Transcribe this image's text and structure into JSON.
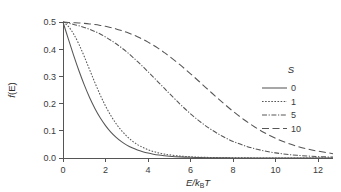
{
  "figure": {
    "background_color": "#ffffff",
    "line_color": "#565656",
    "axis_color": "#555555",
    "width": 341,
    "height": 192
  },
  "chart_data": {
    "type": "line",
    "title": "",
    "subtitle": "",
    "xlabel": "E/kBT",
    "xlabel_parts": {
      "lead": "E/k",
      "sub": "B",
      "tail": "T"
    },
    "ylabel": "f(E)",
    "ylabel_parts": {
      "lead": "f",
      "tail": "(E)"
    },
    "xlim": [
      0,
      12.7
    ],
    "ylim": [
      0,
      0.5
    ],
    "xticks": [
      0,
      2,
      4,
      6,
      8,
      10,
      12
    ],
    "xticklabels": [
      "0",
      "2",
      "4",
      "6",
      "8",
      "10",
      "12"
    ],
    "yticks": [
      0.0,
      0.1,
      0.2,
      0.3,
      0.4,
      0.5
    ],
    "yticklabels": [
      "0.0",
      "0.1",
      "0.2",
      "0.3",
      "0.4",
      "0.5"
    ],
    "grid": false,
    "legend_position": "right",
    "legend_title": "S",
    "x": [
      0,
      0.25,
      0.5,
      0.75,
      1,
      1.25,
      1.5,
      1.75,
      2,
      2.25,
      2.5,
      2.75,
      3,
      3.25,
      3.5,
      3.75,
      4,
      4.25,
      4.5,
      4.75,
      5,
      5.5,
      6,
      6.5,
      7,
      7.5,
      8,
      8.5,
      9,
      9.5,
      10,
      10.5,
      11,
      11.5,
      12,
      12.7
    ],
    "series": [
      {
        "name": "0",
        "label": "0",
        "linestyle": "solid",
        "dasharray": "",
        "values": [
          0.5,
          0.4378,
          0.3775,
          0.3208,
          0.2689,
          0.2227,
          0.1824,
          0.148,
          0.1192,
          0.0953,
          0.0759,
          0.0601,
          0.0474,
          0.0373,
          0.0293,
          0.023,
          0.018,
          0.0141,
          0.011,
          0.0086,
          0.0067,
          0.0041,
          0.0025,
          0.0015,
          0.0009,
          0.0006,
          0.0003,
          0.0002,
          0.0001,
          0.0001,
          0.0,
          0.0,
          0.0,
          0.0,
          0.0,
          0.0
        ]
      },
      {
        "name": "1",
        "label": "1",
        "linestyle": "dotted",
        "dasharray": "1.6,1.5",
        "values": [
          0.5,
          0.484,
          0.456,
          0.418,
          0.373,
          0.325,
          0.277,
          0.232,
          0.191,
          0.156,
          0.126,
          0.101,
          0.08,
          0.063,
          0.0495,
          0.039,
          0.0305,
          0.024,
          0.0188,
          0.0147,
          0.0116,
          0.0072,
          0.0045,
          0.0028,
          0.0018,
          0.0011,
          0.0007,
          0.0005,
          0.0003,
          0.0002,
          0.0001,
          0.0001,
          0.0001,
          0.0,
          0.0,
          0.0
        ]
      },
      {
        "name": "5",
        "label": "5",
        "linestyle": "dashdot",
        "dasharray": "5,1.6,1.2,1.6",
        "values": [
          0.5,
          0.4955,
          0.491,
          0.486,
          0.48,
          0.473,
          0.465,
          0.456,
          0.445,
          0.433,
          0.42,
          0.4055,
          0.39,
          0.373,
          0.355,
          0.3365,
          0.317,
          0.2975,
          0.2775,
          0.2575,
          0.2375,
          0.1985,
          0.1625,
          0.1305,
          0.103,
          0.08,
          0.061,
          0.046,
          0.0345,
          0.0255,
          0.0188,
          0.0138,
          0.01,
          0.0073,
          0.0053,
          0.0033
        ]
      },
      {
        "name": "10",
        "label": "10",
        "linestyle": "dashed",
        "dasharray": "7,3.5",
        "values": [
          0.5,
          0.4985,
          0.4975,
          0.4965,
          0.495,
          0.493,
          0.4905,
          0.4875,
          0.484,
          0.4795,
          0.4745,
          0.4685,
          0.462,
          0.4545,
          0.446,
          0.4365,
          0.426,
          0.4145,
          0.402,
          0.3885,
          0.374,
          0.343,
          0.3095,
          0.2745,
          0.239,
          0.2045,
          0.1715,
          0.1415,
          0.115,
          0.092,
          0.0725,
          0.0565,
          0.0435,
          0.033,
          0.025,
          0.016
        ]
      }
    ]
  }
}
